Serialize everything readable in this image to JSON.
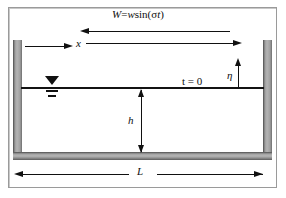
{
  "figure": {
    "type": "schematic-diagram"
  },
  "labels": {
    "wind_forcing": {
      "symbol": "W",
      "equals": "=",
      "amplitude": "w",
      "function": "sin(",
      "frequency": "σ",
      "time": "t",
      "close": ")",
      "full_text": "W = w sin(σt)"
    },
    "x_axis": "x",
    "time_label": "t = 0",
    "surface_elevation": "η",
    "depth": "h",
    "length": "L"
  },
  "arrows": {
    "wind_left": {
      "name": "wind-arrow-left",
      "direction": "left"
    },
    "wind_right": {
      "name": "wind-arrow-right",
      "direction": "right"
    },
    "x_axis": {
      "name": "x-axis-arrow",
      "direction": "right"
    },
    "eta": {
      "name": "eta-arrow",
      "direction": "up"
    },
    "depth": {
      "name": "depth-dimension-arrow",
      "direction": "both-vertical"
    },
    "length": {
      "name": "length-dimension-arrow",
      "direction": "both-horizontal"
    }
  },
  "colors": {
    "line": "#111111",
    "wall_fill": "#b4b4b4",
    "wall_edge": "#4a4a4a",
    "frame_border": "#9a9a9a",
    "background": "#ffffff"
  },
  "elements": {
    "left_wall": "tank-left-wall",
    "right_wall": "tank-right-wall",
    "bottom_wall": "tank-bottom-wall",
    "water_surface": "still-water-level-line",
    "water_symbol": "free-surface-symbol"
  }
}
